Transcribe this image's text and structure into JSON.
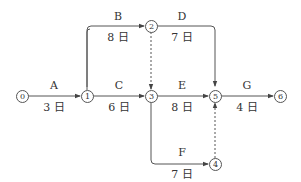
{
  "diagram": {
    "type": "activity-on-arrow network",
    "nodes": [
      {
        "id": "0",
        "label": "0",
        "x": 22,
        "y": 96
      },
      {
        "id": "1",
        "label": "1",
        "x": 87,
        "y": 96
      },
      {
        "id": "2",
        "label": "2",
        "x": 151,
        "y": 26
      },
      {
        "id": "3",
        "label": "3",
        "x": 151,
        "y": 96
      },
      {
        "id": "4",
        "label": "4",
        "x": 215,
        "y": 164
      },
      {
        "id": "5",
        "label": "5",
        "x": 215,
        "y": 96
      },
      {
        "id": "6",
        "label": "6",
        "x": 280,
        "y": 96
      }
    ],
    "activities": [
      {
        "name": "A",
        "duration": "3 日",
        "from": "0",
        "to": "1"
      },
      {
        "name": "B",
        "duration": "8 日",
        "from": "1",
        "to": "2"
      },
      {
        "name": "C",
        "duration": "6 日",
        "from": "1",
        "to": "3"
      },
      {
        "name": "D",
        "duration": "7 日",
        "from": "2",
        "to": "5"
      },
      {
        "name": "E",
        "duration": "8 日",
        "from": "3",
        "to": "5"
      },
      {
        "name": "F",
        "duration": "7 日",
        "from": "3",
        "to": "4"
      },
      {
        "name": "G",
        "duration": "4 日",
        "from": "5",
        "to": "6"
      }
    ],
    "dummies": [
      {
        "from": "2",
        "to": "3"
      },
      {
        "from": "4",
        "to": "5"
      }
    ],
    "line_color": "#555555"
  }
}
